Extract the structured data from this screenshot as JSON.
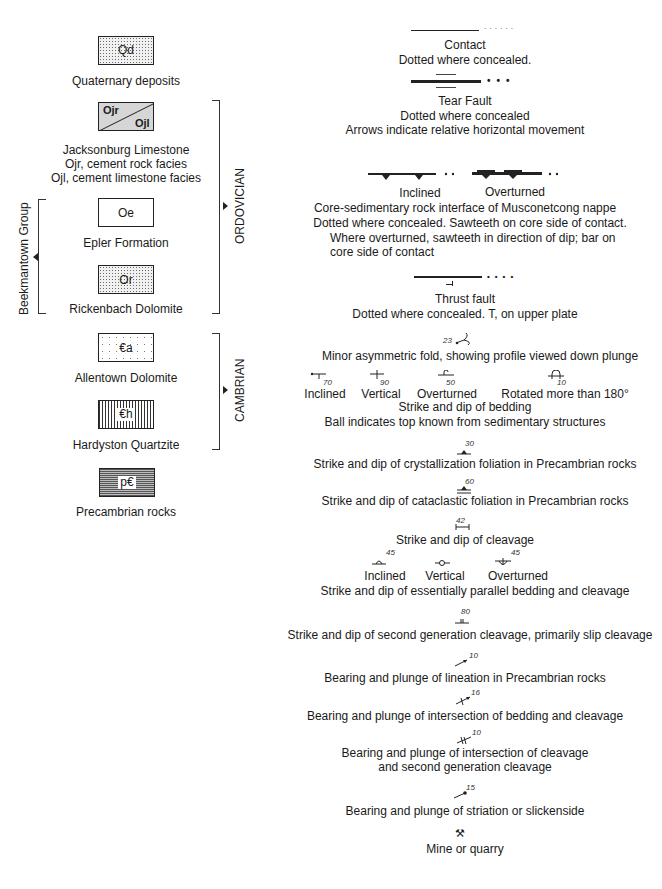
{
  "units": [
    {
      "symbol": "Qd",
      "label": [
        "Quaternary deposits"
      ],
      "pattern": "stipple"
    },
    {
      "symbol_upper": "Ojr",
      "symbol_lower": "Ojl",
      "label": [
        "Jacksonburg Limestone",
        "Ojr, cement rock facies",
        "Ojl, cement limestone facies"
      ],
      "pattern": "gray-diagonal-split"
    },
    {
      "symbol": "Oe",
      "label": [
        "Epler Formation"
      ],
      "pattern": "blank"
    },
    {
      "symbol": "Or",
      "label": [
        "Rickenbach Dolomite"
      ],
      "pattern": "stipple"
    },
    {
      "symbol": "€a",
      "label": [
        "Allentown Dolomite"
      ],
      "pattern": "sparse-dots"
    },
    {
      "symbol": "€h",
      "label": [
        "Hardyston Quartzite"
      ],
      "pattern": "vertical-lines"
    },
    {
      "symbol": "p€",
      "label": [
        "Precambrian rocks"
      ],
      "pattern": "dense-hatch"
    }
  ],
  "groups": {
    "ordovician": "ORDOVICIAN",
    "cambrian": "CAMBRIAN",
    "beekmantown": "Beekmantown Group"
  },
  "symbols": {
    "contact": {
      "title": "Contact",
      "desc": "Dotted where concealed."
    },
    "tear_fault": {
      "title": "Tear Fault",
      "desc1": "Dotted where concealed",
      "desc2": "Arrows indicate relative horizontal movement"
    },
    "core_interface": {
      "inclined": "Inclined",
      "overturned": "Overturned",
      "line1": "Core-sedimentary rock interface of Musconetcong nappe",
      "line2": "Dotted where concealed.   Sawteeth on core side of contact.",
      "line3": "Where overturned,  sawteeth in direction of dip;  bar on",
      "line4": "core side of contact"
    },
    "thrust_fault": {
      "title": "Thrust fault",
      "desc": "Dotted where concealed.   T, on upper plate"
    },
    "minor_fold": {
      "value": "23",
      "desc": "Minor asymmetric fold, showing profile viewed down plunge"
    },
    "bedding": {
      "items": [
        {
          "label": "Inclined",
          "value": "70"
        },
        {
          "label": "Vertical",
          "value": "90"
        },
        {
          "label": "Overturned",
          "value": "50"
        },
        {
          "label": "Rotated more than 180°",
          "value": "10"
        }
      ],
      "title": "Strike and dip of bedding",
      "desc": "Ball indicates top known from sedimentary structures"
    },
    "crystallization_foliation": {
      "value": "30",
      "desc": "Strike and dip of crystallization foliation in Precambrian rocks"
    },
    "cataclastic_foliation": {
      "value": "60",
      "desc": "Strike and dip of cataclastic foliation in Precambrian rocks"
    },
    "cleavage": {
      "value": "42",
      "desc": "Strike and dip of cleavage"
    },
    "parallel_bedding_cleavage": {
      "items": [
        {
          "label": "Inclined",
          "value": "45"
        },
        {
          "label": "Vertical",
          "value": ""
        },
        {
          "label": "Overturned",
          "value": "45"
        }
      ],
      "desc": "Strike and dip of essentially parallel bedding and cleavage"
    },
    "second_gen_cleavage": {
      "value": "80",
      "desc": "Strike and dip of second generation cleavage, primarily slip cleavage"
    },
    "lineation": {
      "value": "10",
      "desc": "Bearing and plunge of lineation in Precambrian rocks"
    },
    "intersection_bedding_cleavage": {
      "value": "16",
      "desc": "Bearing and plunge of intersection of bedding and cleavage"
    },
    "intersection_cleavages": {
      "value": "10",
      "desc1": "Bearing and plunge of intersection of cleavage",
      "desc2": "and second generation cleavage"
    },
    "striation": {
      "value": "15",
      "desc": "Bearing and plunge of  striation or slickenside"
    },
    "mine": {
      "glyph": "⚒",
      "desc": "Mine or quarry"
    }
  }
}
